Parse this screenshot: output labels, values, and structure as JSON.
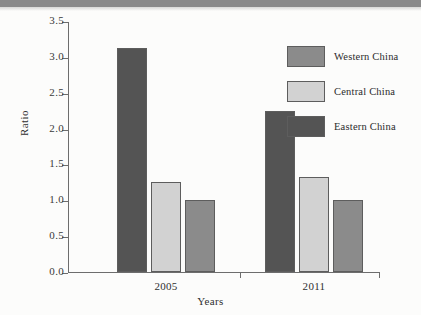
{
  "chart_data": {
    "type": "bar",
    "title": "",
    "xlabel": "Years",
    "ylabel": "Ratio",
    "categories": [
      "2005",
      "2011"
    ],
    "series": [
      {
        "name": "Western China",
        "values": [
          1.0,
          1.0
        ],
        "color": "#8b8b8b"
      },
      {
        "name": "Central China",
        "values": [
          1.25,
          1.32
        ],
        "color": "#d2d2d2"
      },
      {
        "name": "Eastern China",
        "values": [
          3.13,
          2.25
        ],
        "color": "#545454"
      }
    ],
    "draw_order": [
      "Eastern China",
      "Central China",
      "Western China"
    ],
    "ylim": [
      0.0,
      3.5
    ],
    "yticks": [
      "0.0",
      "0.5",
      "1.0",
      "1.5",
      "2.0",
      "2.5",
      "3.0",
      "3.5"
    ],
    "ytick_values": [
      0.0,
      0.5,
      1.0,
      1.5,
      2.0,
      2.5,
      3.0,
      3.5
    ],
    "grid": false,
    "legend_position": "top-right"
  },
  "axes": {
    "y_title": "Ratio",
    "x_title": "Years"
  },
  "legend": {
    "entries": [
      {
        "label": "Western China",
        "color": "#8b8b8b"
      },
      {
        "label": "Central China",
        "color": "#d2d2d2"
      },
      {
        "label": "Eastern China",
        "color": "#545454"
      }
    ]
  }
}
